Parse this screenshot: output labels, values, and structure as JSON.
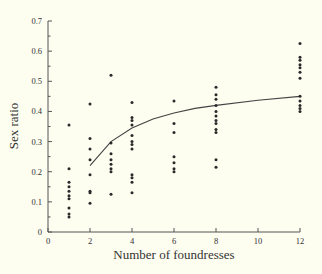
{
  "chart_data": {
    "type": "scatter",
    "title": "",
    "xlabel": "Number of foundresses",
    "ylabel": "Sex ratio",
    "xlim": [
      0,
      12
    ],
    "ylim": [
      0,
      0.7
    ],
    "x_ticks": [
      "0",
      "2",
      "4",
      "6",
      "8",
      "10",
      "12"
    ],
    "y_ticks": [
      "0",
      "0.1",
      "0.2",
      "0.3",
      "0.4",
      "0.5",
      "0.6",
      "0.7"
    ],
    "grid": false,
    "legend": null,
    "series": [
      {
        "name": "observed",
        "kind": "points",
        "points": [
          [
            1,
            0.355
          ],
          [
            1,
            0.21
          ],
          [
            1,
            0.165
          ],
          [
            1,
            0.15
          ],
          [
            1,
            0.135
          ],
          [
            1,
            0.12
          ],
          [
            1,
            0.11
          ],
          [
            1,
            0.08
          ],
          [
            1,
            0.06
          ],
          [
            1,
            0.05
          ],
          [
            2,
            0.425
          ],
          [
            2,
            0.31
          ],
          [
            2,
            0.275
          ],
          [
            2,
            0.24
          ],
          [
            2,
            0.19
          ],
          [
            2,
            0.135
          ],
          [
            2,
            0.13
          ],
          [
            2,
            0.095
          ],
          [
            3,
            0.52
          ],
          [
            3,
            0.295
          ],
          [
            3,
            0.26
          ],
          [
            3,
            0.24
          ],
          [
            3,
            0.225
          ],
          [
            3,
            0.21
          ],
          [
            3,
            0.2
          ],
          [
            3,
            0.125
          ],
          [
            4,
            0.43
          ],
          [
            4,
            0.38
          ],
          [
            4,
            0.37
          ],
          [
            4,
            0.355
          ],
          [
            4,
            0.32
          ],
          [
            4,
            0.3
          ],
          [
            4,
            0.29
          ],
          [
            4,
            0.275
          ],
          [
            4,
            0.19
          ],
          [
            4,
            0.18
          ],
          [
            4,
            0.165
          ],
          [
            4,
            0.13
          ],
          [
            6,
            0.435
          ],
          [
            6,
            0.36
          ],
          [
            6,
            0.33
          ],
          [
            6,
            0.25
          ],
          [
            6,
            0.23
          ],
          [
            6,
            0.21
          ],
          [
            6,
            0.2
          ],
          [
            8,
            0.48
          ],
          [
            8,
            0.455
          ],
          [
            8,
            0.44
          ],
          [
            8,
            0.42
          ],
          [
            8,
            0.4
          ],
          [
            8,
            0.385
          ],
          [
            8,
            0.37
          ],
          [
            8,
            0.36
          ],
          [
            8,
            0.34
          ],
          [
            8,
            0.33
          ],
          [
            8,
            0.24
          ],
          [
            8,
            0.215
          ],
          [
            12,
            0.625
          ],
          [
            12,
            0.58
          ],
          [
            12,
            0.57
          ],
          [
            12,
            0.555
          ],
          [
            12,
            0.545
          ],
          [
            12,
            0.53
          ],
          [
            12,
            0.51
          ],
          [
            12,
            0.45
          ],
          [
            12,
            0.435
          ],
          [
            12,
            0.42
          ],
          [
            12,
            0.41
          ],
          [
            12,
            0.4
          ]
        ]
      },
      {
        "name": "predicted",
        "kind": "line",
        "points": [
          [
            2,
            0.22
          ],
          [
            3,
            0.3
          ],
          [
            4,
            0.345
          ],
          [
            5,
            0.375
          ],
          [
            6,
            0.395
          ],
          [
            7,
            0.41
          ],
          [
            8,
            0.42
          ],
          [
            10,
            0.437
          ],
          [
            12,
            0.45
          ]
        ]
      }
    ]
  }
}
